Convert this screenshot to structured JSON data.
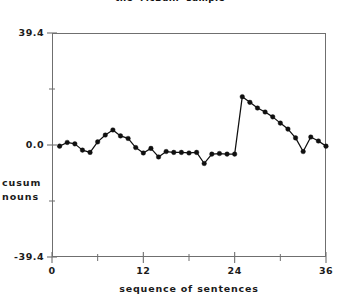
{
  "chart_data": {
    "type": "line",
    "title": "the  McBain  sample",
    "xlabel": "sequence  of  sentences",
    "ylabel_lines": [
      "cusum",
      "nouns"
    ],
    "ylabel": "cusum nouns",
    "xlim": [
      0,
      36
    ],
    "ylim": [
      -39.4,
      39.4
    ],
    "grid": false,
    "legend": null,
    "marker": "filled-circle",
    "line_color": "#101010",
    "marker_color": "#101010",
    "axis_color": "#6f6f6f",
    "background": "#ffffff",
    "xticks_major": [
      0,
      12,
      24,
      36
    ],
    "xticks_major_labels": [
      "0",
      "12",
      "24",
      "36"
    ],
    "xticks_minor": [
      6,
      18,
      30
    ],
    "yticks_major": [
      39.4,
      0.0,
      -39.4
    ],
    "yticks_major_labels": [
      "39.4",
      "0.0",
      "-39.4"
    ],
    "yticks_minor": [
      19.7,
      -19.7
    ],
    "note": "one long un-marked straight segment runs from sequence 14 to the peak at sequence 25",
    "x": [
      1,
      2,
      3,
      4,
      5,
      6,
      7,
      8,
      9,
      10,
      11,
      12,
      13,
      14,
      15,
      16,
      17,
      18,
      19,
      20,
      21,
      22,
      23,
      24,
      25,
      26,
      27,
      28,
      29,
      30,
      31,
      32,
      33,
      34,
      35,
      36
    ],
    "y": [
      -0.4,
      0.9,
      0.4,
      -1.8,
      -2.6,
      1.1,
      3.5,
      5.3,
      3.2,
      2.3,
      -0.9,
      -2.8,
      -1.2,
      -4.2,
      -2.3,
      -2.6,
      -2.6,
      -2.8,
      -2.6,
      -6.5,
      -3.2,
      -3.0,
      -3.2,
      -3.2,
      17.0,
      15.0,
      13.0,
      11.6,
      9.9,
      7.7,
      5.6,
      2.5,
      -2.3,
      2.8,
      1.4,
      -0.4
    ],
    "series": [
      {
        "name": "cusum nouns",
        "marked_points": [
          {
            "x": 1,
            "y": -0.4
          },
          {
            "x": 2,
            "y": 0.9
          },
          {
            "x": 3,
            "y": 0.4
          },
          {
            "x": 4,
            "y": -1.8
          },
          {
            "x": 5,
            "y": -2.6
          },
          {
            "x": 6,
            "y": 1.1
          },
          {
            "x": 7,
            "y": 3.5
          },
          {
            "x": 8,
            "y": 5.3
          },
          {
            "x": 9,
            "y": 3.2
          },
          {
            "x": 10,
            "y": 2.3
          },
          {
            "x": 11,
            "y": -0.9
          },
          {
            "x": 12,
            "y": -2.8
          },
          {
            "x": 13,
            "y": -1.2
          },
          {
            "x": 14,
            "y": -4.2
          },
          {
            "x": 15,
            "y": -2.3
          },
          {
            "x": 16,
            "y": -2.6
          },
          {
            "x": 17,
            "y": -2.6
          },
          {
            "x": 18,
            "y": -2.8
          },
          {
            "x": 19,
            "y": -2.6
          },
          {
            "x": 20,
            "y": -6.5
          },
          {
            "x": 21,
            "y": -3.2
          },
          {
            "x": 22,
            "y": -3.0
          },
          {
            "x": 23,
            "y": -3.2
          },
          {
            "x": 24,
            "y": -3.2
          },
          {
            "x": 25,
            "y": 17.0
          },
          {
            "x": 26,
            "y": 15.0
          },
          {
            "x": 27,
            "y": 13.0
          },
          {
            "x": 28,
            "y": 11.6
          },
          {
            "x": 29,
            "y": 9.9
          },
          {
            "x": 30,
            "y": 7.7
          },
          {
            "x": 31,
            "y": 5.6
          },
          {
            "x": 32,
            "y": 2.5
          },
          {
            "x": 33,
            "y": -2.3
          },
          {
            "x": 34,
            "y": 2.8
          },
          {
            "x": 35,
            "y": 1.4
          },
          {
            "x": 36,
            "y": -0.4
          }
        ]
      }
    ]
  }
}
